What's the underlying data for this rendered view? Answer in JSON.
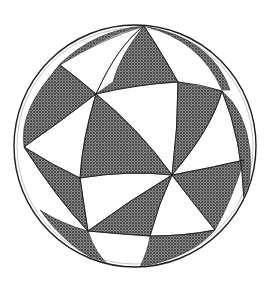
{
  "figure": {
    "description": "Sphere partitioned by great circles into alternating shaded and unshaded spherical triangles",
    "colors": {
      "background": "#ffffff",
      "outline": "#1a1a1a",
      "hatch_dark": "#3c3c3c",
      "hatch_light": "#8a8a8a"
    },
    "sphere": {
      "cx": 135,
      "cy": 146,
      "r": 121
    }
  }
}
